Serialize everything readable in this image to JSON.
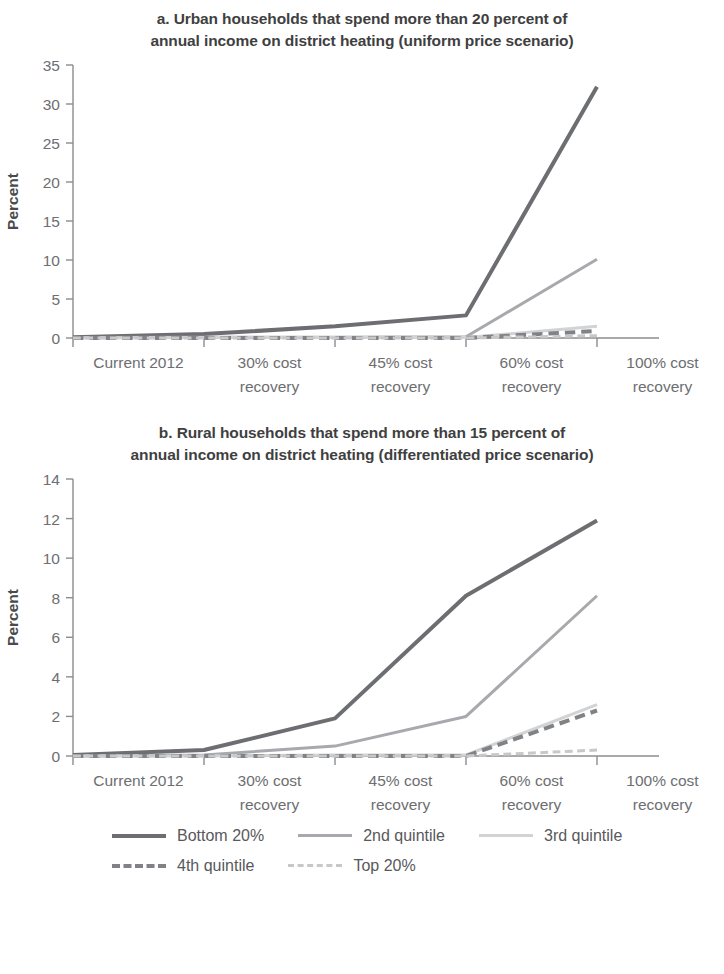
{
  "figure": {
    "axis_label": "Percent"
  },
  "legend": {
    "rows": [
      [
        {
          "label": "Bottom 20%",
          "color": "#6d6e71",
          "style": "solid",
          "width": 4
        },
        {
          "label": "2nd quintile",
          "color": "#a7a9ac",
          "style": "solid",
          "width": 3
        },
        {
          "label": "3rd quintile",
          "color": "#d1d3d4",
          "style": "solid",
          "width": 3
        }
      ],
      [
        {
          "label": "4th quintile",
          "color": "#808285",
          "style": "dashed",
          "width": 4
        },
        {
          "label": "Top 20%",
          "color": "#c7c8ca",
          "style": "dashed",
          "width": 3
        }
      ]
    ]
  },
  "chart_data": [
    {
      "type": "line",
      "panel": "a",
      "title": "a. Urban households that spend more than 20 percent of annual income on district heating  (uniform price scenario)",
      "title_line1": "a. Urban households that spend more than 20 percent of",
      "title_line2": "annual income on district heating  (uniform price scenario)",
      "xlabel": "",
      "ylabel": "Percent",
      "categories": [
        "Current 2012",
        "30% cost recovery",
        "45% cost recovery",
        "60% cost recovery",
        "100% cost recovery"
      ],
      "category_lines": [
        [
          "Current 2012",
          ""
        ],
        [
          "30% cost",
          "recovery"
        ],
        [
          "45% cost",
          "recovery"
        ],
        [
          "60% cost",
          "recovery"
        ],
        [
          "100% cost",
          "recovery"
        ]
      ],
      "ylim": [
        0,
        35
      ],
      "yticks": [
        0,
        5,
        10,
        15,
        20,
        25,
        30,
        35
      ],
      "grid": false,
      "legend_position": "bottom-shared",
      "series": [
        {
          "name": "Bottom 20%",
          "color": "#6d6e71",
          "style": "solid",
          "width": 4,
          "values": [
            0.1,
            0.5,
            1.5,
            2.9,
            32.2
          ]
        },
        {
          "name": "2nd quintile",
          "color": "#a7a9ac",
          "style": "solid",
          "width": 3,
          "values": [
            0.05,
            0.1,
            0.1,
            0.15,
            10.1
          ]
        },
        {
          "name": "3rd quintile",
          "color": "#d1d3d4",
          "style": "solid",
          "width": 3,
          "values": [
            0.0,
            0.05,
            0.05,
            0.05,
            1.5
          ]
        },
        {
          "name": "4th quintile",
          "color": "#808285",
          "style": "dashed",
          "width": 4,
          "values": [
            0.0,
            0.0,
            0.0,
            0.0,
            0.9
          ]
        },
        {
          "name": "Top 20%",
          "color": "#c7c8ca",
          "style": "dashed",
          "width": 3,
          "values": [
            0.0,
            0.0,
            0.0,
            0.0,
            0.3
          ]
        }
      ]
    },
    {
      "type": "line",
      "panel": "b",
      "title": "b. Rural households that spend more than 15 percent of annual income on district heating  (differentiated price scenario)",
      "title_line1": "b. Rural households that spend more than 15 percent of",
      "title_line2": "annual income on district heating  (differentiated price scenario)",
      "xlabel": "",
      "ylabel": "Percent",
      "categories": [
        "Current 2012",
        "30% cost recovery",
        "45% cost recovery",
        "60% cost recovery",
        "100% cost recovery"
      ],
      "category_lines": [
        [
          "Current 2012",
          ""
        ],
        [
          "30% cost",
          "recovery"
        ],
        [
          "45% cost",
          "recovery"
        ],
        [
          "60% cost",
          "recovery"
        ],
        [
          "100% cost",
          "recovery"
        ]
      ],
      "ylim": [
        0,
        14
      ],
      "yticks": [
        0,
        2,
        4,
        6,
        8,
        10,
        12,
        14
      ],
      "grid": false,
      "legend_position": "bottom-shared",
      "series": [
        {
          "name": "Bottom 20%",
          "color": "#6d6e71",
          "style": "solid",
          "width": 4,
          "values": [
            0.05,
            0.3,
            1.9,
            8.1,
            11.9
          ]
        },
        {
          "name": "2nd quintile",
          "color": "#a7a9ac",
          "style": "solid",
          "width": 3,
          "values": [
            0.0,
            0.05,
            0.5,
            2.0,
            8.1
          ]
        },
        {
          "name": "3rd quintile",
          "color": "#d1d3d4",
          "style": "solid",
          "width": 3,
          "values": [
            0.0,
            0.0,
            0.05,
            0.05,
            2.6
          ]
        },
        {
          "name": "4th quintile",
          "color": "#808285",
          "style": "dashed",
          "width": 4,
          "values": [
            0.0,
            0.0,
            0.0,
            0.0,
            2.3
          ]
        },
        {
          "name": "Top 20%",
          "color": "#c7c8ca",
          "style": "dashed",
          "width": 3,
          "values": [
            0.0,
            0.0,
            0.0,
            0.0,
            0.3
          ]
        }
      ]
    }
  ]
}
